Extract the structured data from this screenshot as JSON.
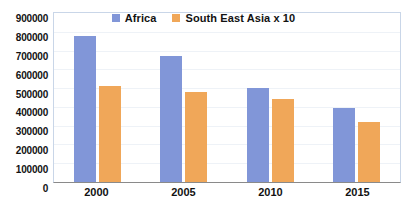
{
  "chart_data": {
    "type": "bar",
    "title": "",
    "xlabel": "",
    "ylabel": "",
    "categories": [
      "2000",
      "2005",
      "2010",
      "2015"
    ],
    "series": [
      {
        "name": "Africa",
        "color": "#8196d8",
        "values": [
          775000,
          670000,
          500000,
          395000
        ]
      },
      {
        "name": "South East Asia x 10",
        "color": "#f0a759",
        "values": [
          510000,
          480000,
          440000,
          320000
        ]
      }
    ],
    "ylim": [
      0,
      900000
    ],
    "ytick_step": 100000,
    "yticks": [
      "900000",
      "800000",
      "700000",
      "600000",
      "500000",
      "400000",
      "300000",
      "200000",
      "100000",
      "0"
    ],
    "grid": true,
    "legend_position": "top-center"
  }
}
